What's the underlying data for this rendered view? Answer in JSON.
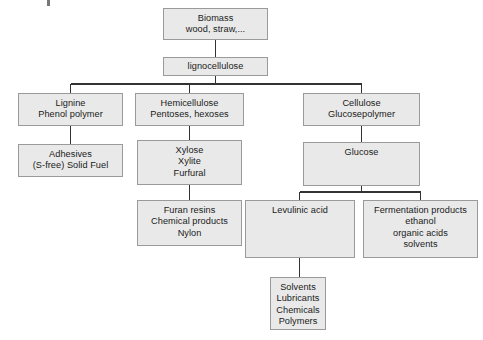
{
  "diagram": {
    "type": "flowchart",
    "canvas": {
      "width": 483,
      "height": 340
    },
    "style": {
      "box_fill": "#e9e9e9",
      "box_border": "#9a9a9a",
      "connector_color": "#333333",
      "text_color": "#1a1a1a",
      "background": "#ffffff"
    },
    "nodes": [
      {
        "id": "biomass",
        "text": "Biomass\nwood, straw,...",
        "x": 163,
        "y": 8,
        "w": 105,
        "h": 32
      },
      {
        "id": "lignocellulose",
        "text": "lignocellulose",
        "x": 163,
        "y": 57,
        "w": 105,
        "h": 19
      },
      {
        "id": "lignine",
        "text": "Lignine\nPhenol polymer",
        "x": 18,
        "y": 93,
        "w": 105,
        "h": 33
      },
      {
        "id": "hemicellulose",
        "text": "Hemicellulose\nPentoses, hexoses",
        "x": 135,
        "y": 93,
        "w": 109,
        "h": 33
      },
      {
        "id": "cellulose",
        "text": "Cellulose\nGlucosepolymer",
        "x": 303,
        "y": 93,
        "w": 117,
        "h": 33
      },
      {
        "id": "adhesives",
        "text": "Adhesives\n(S-free) Solid Fuel",
        "x": 18,
        "y": 144,
        "w": 105,
        "h": 33
      },
      {
        "id": "xylose",
        "text": "Xylose\nXylite\nFurfural",
        "x": 137,
        "y": 140,
        "w": 105,
        "h": 45
      },
      {
        "id": "glucose",
        "text": "Glucose",
        "x": 303,
        "y": 142,
        "w": 117,
        "h": 44
      },
      {
        "id": "furan",
        "text": "Furan resins\nChemical products\nNylon",
        "x": 137,
        "y": 200,
        "w": 105,
        "h": 46
      },
      {
        "id": "levulinic",
        "text": "Levulinic acid",
        "x": 245,
        "y": 200,
        "w": 110,
        "h": 58
      },
      {
        "id": "fermentation",
        "text": "Fermentation products\nethanol\norganic acids\nsolvents",
        "x": 363,
        "y": 200,
        "w": 115,
        "h": 58
      },
      {
        "id": "solvents",
        "text": "Solvents\nLubricants\nChemicals\nPolymers",
        "x": 270,
        "y": 277,
        "w": 56,
        "h": 53
      }
    ],
    "edges": [
      {
        "from": "biomass",
        "to": "lignocellulose"
      },
      {
        "from": "lignocellulose",
        "to": "lignine"
      },
      {
        "from": "lignocellulose",
        "to": "hemicellulose"
      },
      {
        "from": "lignocellulose",
        "to": "cellulose"
      },
      {
        "from": "lignine",
        "to": "adhesives"
      },
      {
        "from": "hemicellulose",
        "to": "xylose"
      },
      {
        "from": "xylose",
        "to": "furan"
      },
      {
        "from": "cellulose",
        "to": "glucose"
      },
      {
        "from": "glucose",
        "to": "levulinic"
      },
      {
        "from": "glucose",
        "to": "fermentation"
      },
      {
        "from": "levulinic",
        "to": "solvents"
      }
    ]
  }
}
